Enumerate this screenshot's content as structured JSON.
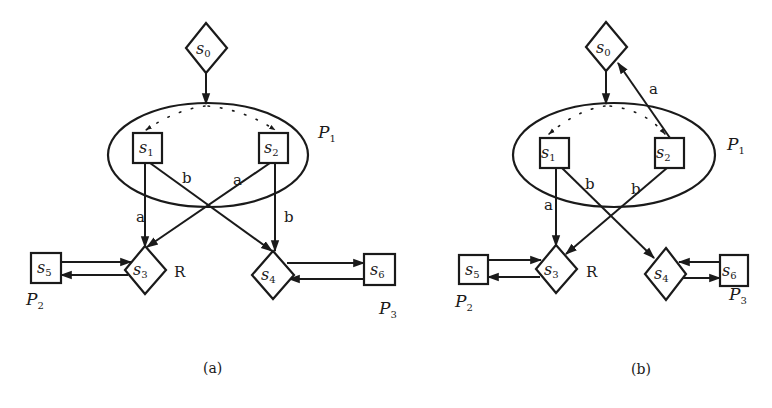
{
  "panels": [
    {
      "caption": "(a)",
      "nodes": {
        "s0": {
          "base": "s",
          "sub": "0",
          "shape": "diamond"
        },
        "s1": {
          "base": "s",
          "sub": "1",
          "shape": "box"
        },
        "s2": {
          "base": "s",
          "sub": "2",
          "shape": "box"
        },
        "s3": {
          "base": "s",
          "sub": "3",
          "shape": "diamond"
        },
        "s4": {
          "base": "s",
          "sub": "4",
          "shape": "diamond"
        },
        "s5": {
          "base": "s",
          "sub": "5",
          "shape": "box"
        },
        "s6": {
          "base": "s",
          "sub": "6",
          "shape": "box"
        }
      },
      "partitions": {
        "p1": {
          "base": "P",
          "sub": "1"
        },
        "p2": {
          "base": "P",
          "sub": "2"
        },
        "p3": {
          "base": "P",
          "sub": "3"
        }
      },
      "region_label": "R",
      "edges": [
        {
          "from": "s0",
          "to": "P1",
          "label": ""
        },
        {
          "from": "s1",
          "to": "s3",
          "label": "a"
        },
        {
          "from": "s1",
          "to": "s4",
          "label": "b"
        },
        {
          "from": "s2",
          "to": "s3",
          "label": "a"
        },
        {
          "from": "s2",
          "to": "s4",
          "label": "b"
        },
        {
          "from": "s5",
          "to": "s3",
          "label": ""
        },
        {
          "from": "s3",
          "to": "s5",
          "label": ""
        },
        {
          "from": "s4",
          "to": "s6",
          "label": ""
        },
        {
          "from": "s6",
          "to": "s4",
          "label": ""
        }
      ]
    },
    {
      "caption": "(b)",
      "nodes": {
        "s0": {
          "base": "s",
          "sub": "0",
          "shape": "diamond"
        },
        "s1": {
          "base": "s",
          "sub": "1",
          "shape": "box"
        },
        "s2": {
          "base": "s",
          "sub": "2",
          "shape": "box"
        },
        "s3": {
          "base": "s",
          "sub": "3",
          "shape": "diamond"
        },
        "s4": {
          "base": "s",
          "sub": "4",
          "shape": "diamond"
        },
        "s5": {
          "base": "s",
          "sub": "5",
          "shape": "box"
        },
        "s6": {
          "base": "s",
          "sub": "6",
          "shape": "box"
        }
      },
      "partitions": {
        "p1": {
          "base": "P",
          "sub": "1"
        },
        "p2": {
          "base": "P",
          "sub": "2"
        },
        "p3": {
          "base": "P",
          "sub": "3"
        }
      },
      "region_label": "R",
      "edges": [
        {
          "from": "s0",
          "to": "P1",
          "label": ""
        },
        {
          "from": "s2",
          "to": "s0",
          "label": "a"
        },
        {
          "from": "s1",
          "to": "s3",
          "label": "a"
        },
        {
          "from": "s1",
          "to": "s4",
          "label": "b"
        },
        {
          "from": "s2",
          "to": "s3",
          "label": "b"
        },
        {
          "from": "s5",
          "to": "s3",
          "label": ""
        },
        {
          "from": "s3",
          "to": "s5",
          "label": ""
        },
        {
          "from": "s6",
          "to": "s4",
          "label": ""
        },
        {
          "from": "s4",
          "to": "s6",
          "label": ""
        }
      ]
    }
  ]
}
